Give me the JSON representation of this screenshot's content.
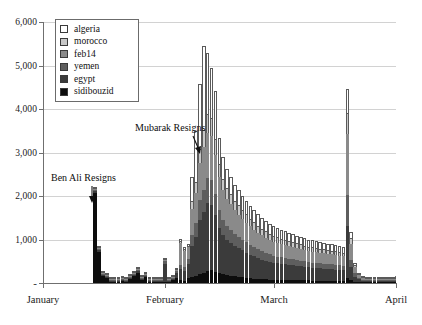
{
  "chart_data": {
    "type": "bar",
    "title": "",
    "subtitle": "",
    "xlabel": "",
    "ylabel": "",
    "stacked": true,
    "grid": true,
    "legend_position": "top-left",
    "ylim": [
      0,
      6000
    ],
    "ytick_labels": [
      "6,000",
      "5,000",
      "4,000",
      "3,000",
      "2,000",
      "1,000",
      "-"
    ],
    "ytick_values": [
      6000,
      5000,
      4000,
      3000,
      2000,
      1000,
      0
    ],
    "xtick_labels": [
      "January",
      "February",
      "March",
      "April"
    ],
    "xtick_values": [
      0,
      31,
      59,
      90
    ],
    "x_range_days": [
      0,
      90
    ],
    "series": [
      {
        "name": "sidibouzid",
        "color": "#0d0d0d",
        "values": [
          0,
          0,
          0,
          0,
          0,
          0,
          0,
          0,
          0,
          0,
          0,
          0,
          0,
          2150,
          780,
          230,
          180,
          100,
          55,
          45,
          120,
          90,
          170,
          230,
          300,
          150,
          200,
          60,
          40,
          35,
          30,
          25,
          30,
          120,
          140,
          60,
          50,
          110,
          140,
          150,
          200,
          230,
          280,
          300,
          260,
          220,
          200,
          180,
          170,
          150,
          140,
          130,
          120,
          110,
          100,
          95,
          90,
          85,
          80,
          78,
          75,
          72,
          70,
          68,
          66,
          64,
          62,
          60,
          58,
          56,
          54,
          52,
          50,
          48,
          46,
          44,
          42,
          40,
          120,
          60,
          30,
          20,
          15,
          12,
          10,
          8,
          6,
          5,
          4,
          3,
          2
        ]
      },
      {
        "name": "egypt",
        "color": "#3b3b3b",
        "values": [
          0,
          0,
          0,
          0,
          0,
          0,
          0,
          0,
          0,
          0,
          0,
          0,
          0,
          30,
          40,
          30,
          25,
          20,
          15,
          15,
          20,
          18,
          25,
          30,
          35,
          20,
          25,
          15,
          12,
          10,
          10,
          440,
          40,
          40,
          120,
          260,
          230,
          330,
          700,
          900,
          1250,
          1400,
          1550,
          1500,
          1300,
          1050,
          900,
          820,
          760,
          700,
          660,
          620,
          580,
          540,
          510,
          480,
          450,
          430,
          410,
          390,
          380,
          370,
          360,
          350,
          340,
          330,
          320,
          310,
          300,
          295,
          290,
          285,
          280,
          275,
          270,
          265,
          260,
          255,
          1200,
          300,
          120,
          60,
          40,
          30,
          25,
          20,
          15,
          12,
          10,
          8,
          5
        ]
      },
      {
        "name": "yemen",
        "color": "#5e5e5e",
        "values": [
          0,
          0,
          0,
          0,
          0,
          0,
          0,
          0,
          0,
          0,
          0,
          0,
          0,
          10,
          12,
          8,
          8,
          6,
          5,
          5,
          7,
          6,
          8,
          10,
          12,
          8,
          9,
          6,
          5,
          4,
          4,
          60,
          15,
          15,
          40,
          90,
          80,
          120,
          260,
          330,
          450,
          520,
          580,
          560,
          490,
          400,
          350,
          320,
          300,
          280,
          265,
          250,
          235,
          220,
          208,
          196,
          185,
          176,
          168,
          160,
          155,
          150,
          146,
          142,
          138,
          134,
          130,
          126,
          122,
          120,
          118,
          116,
          114,
          112,
          110,
          108,
          106,
          104,
          700,
          180,
          70,
          35,
          22,
          16,
          13,
          10,
          8,
          6,
          5,
          4,
          3
        ]
      },
      {
        "name": "feb14",
        "color": "#8a8a8a",
        "values": [
          0,
          0,
          0,
          0,
          0,
          0,
          0,
          0,
          0,
          0,
          0,
          0,
          0,
          5,
          6,
          4,
          4,
          3,
          3,
          3,
          4,
          3,
          4,
          5,
          6,
          4,
          5,
          3,
          3,
          2,
          2,
          30,
          8,
          8,
          20,
          500,
          380,
          260,
          600,
          700,
          860,
          980,
          1050,
          1020,
          900,
          760,
          680,
          620,
          580,
          540,
          510,
          480,
          455,
          430,
          410,
          390,
          372,
          355,
          340,
          325,
          315,
          306,
          298,
          290,
          282,
          275,
          268,
          261,
          254,
          250,
          246,
          242,
          238,
          234,
          230,
          226,
          222,
          218,
          1400,
          360,
          140,
          70,
          45,
          32,
          26,
          20,
          16,
          12,
          10,
          8,
          6
        ]
      },
      {
        "name": "morocco",
        "color": "#c8c8c8",
        "values": [
          0,
          0,
          0,
          0,
          0,
          0,
          0,
          0,
          0,
          0,
          0,
          0,
          0,
          3,
          3,
          2,
          2,
          2,
          2,
          2,
          2,
          2,
          2,
          3,
          3,
          2,
          2,
          2,
          2,
          1,
          1,
          15,
          4,
          4,
          10,
          60,
          50,
          40,
          180,
          240,
          320,
          380,
          430,
          410,
          350,
          300,
          270,
          250,
          235,
          220,
          208,
          196,
          186,
          176,
          168,
          160,
          152,
          146,
          140,
          134,
          130,
          126,
          122,
          118,
          114,
          111,
          108,
          105,
          102,
          100,
          98,
          96,
          94,
          92,
          90,
          88,
          86,
          84,
          480,
          130,
          50,
          25,
          16,
          12,
          10,
          8,
          6,
          5,
          4,
          3,
          2
        ]
      },
      {
        "name": "algeria",
        "color": "#ffffff",
        "values": [
          0,
          0,
          0,
          0,
          0,
          0,
          0,
          0,
          0,
          0,
          0,
          0,
          0,
          2,
          2,
          2,
          2,
          1,
          1,
          1,
          2,
          1,
          2,
          2,
          2,
          1,
          2,
          1,
          1,
          1,
          1,
          10,
          3,
          3,
          8,
          50,
          40,
          30,
          560,
          1180,
          1500,
          1950,
          1400,
          1160,
          1120,
          600,
          500,
          440,
          400,
          370,
          345,
          325,
          305,
          290,
          275,
          262,
          250,
          238,
          228,
          218,
          210,
          203,
          196,
          190,
          184,
          179,
          174,
          169,
          164,
          160,
          157,
          154,
          151,
          148,
          145,
          142,
          139,
          136,
          560,
          150,
          60,
          30,
          20,
          15,
          12,
          9,
          7,
          6,
          5,
          4,
          3
        ]
      }
    ],
    "annotations": [
      {
        "id": "ben-ali",
        "text": "Ben Ali Resigns",
        "points_to_day": 13,
        "points_to_value": 2200
      },
      {
        "id": "mubarak",
        "text": "Mubarak Resigns",
        "points_to_day": 41,
        "points_to_value": 2900
      }
    ]
  },
  "legend": {
    "items": [
      {
        "label": "algeria",
        "color": "#ffffff"
      },
      {
        "label": "morocco",
        "color": "#c8c8c8"
      },
      {
        "label": "feb14",
        "color": "#8a8a8a"
      },
      {
        "label": "yemen",
        "color": "#5e5e5e"
      },
      {
        "label": "egypt",
        "color": "#3b3b3b"
      },
      {
        "label": "sidibouzid",
        "color": "#0d0d0d"
      }
    ]
  },
  "annotations": {
    "ben_ali": "Ben Ali Resigns",
    "mubarak": "Mubarak Resigns"
  }
}
